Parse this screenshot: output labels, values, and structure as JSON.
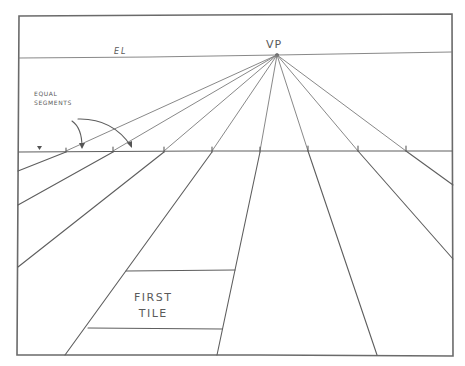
{
  "diagram": {
    "type": "one-point perspective construction sketch",
    "style": "pencil on paper",
    "colors": {
      "pencil": "#5e5e5e",
      "paper": "#ffffff"
    },
    "labels": {
      "vanishing_point": "VP",
      "eye_level": "EL",
      "equal_segments": "EQUAL\nSEGMENTS",
      "first_tile": "FIRST\nTILE"
    },
    "frame": {
      "left": 18,
      "top": 15,
      "right": 453,
      "bottom": 356
    },
    "eye_level_line": {
      "y_left": 58,
      "y_right": 52
    },
    "vanishing_point": {
      "x": 277,
      "y": 55
    },
    "ground_line": {
      "y": 151,
      "tick_x": [
        66,
        113,
        164,
        212,
        260,
        308,
        358,
        406
      ]
    },
    "orthogonals_end_points": [
      [
        18,
        171
      ],
      [
        18,
        205
      ],
      [
        18,
        267
      ],
      [
        65,
        355
      ],
      [
        217,
        355
      ],
      [
        377,
        355
      ],
      [
        453,
        259
      ],
      [
        453,
        185
      ]
    ],
    "first_tile": {
      "top_y": 271,
      "top_x": [
        126,
        235
      ],
      "bottom_y": 328,
      "bottom_x": [
        88,
        222
      ]
    }
  }
}
